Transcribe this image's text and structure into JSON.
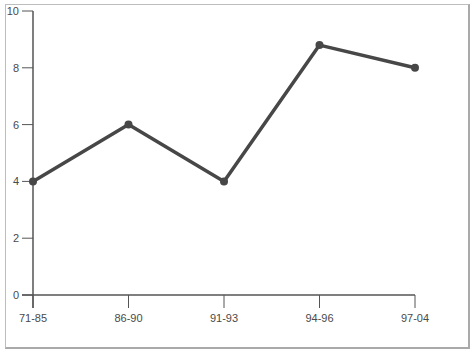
{
  "chart_data": {
    "type": "line",
    "title": "",
    "xlabel": "",
    "ylabel": "",
    "categories": [
      "71-85",
      "86-90",
      "91-93",
      "94-96",
      "97-04"
    ],
    "series": [
      {
        "name": "",
        "values": [
          4,
          6,
          4,
          8.8,
          8
        ],
        "color": "#474747"
      }
    ],
    "ylim": [
      0,
      10
    ],
    "yticks": [
      0,
      2,
      4,
      6,
      8,
      10
    ],
    "grid": false,
    "legend": null
  },
  "axis": {
    "y_labels": [
      "0",
      "2",
      "4",
      "6",
      "8",
      "10"
    ],
    "x_labels": [
      "71-85",
      "86-90",
      "91-93",
      "94-96",
      "97-04"
    ]
  },
  "colors": {
    "line": "#474747",
    "axis": "#555555",
    "frame": "#bdbdbd",
    "text": "#4a4a4a"
  }
}
